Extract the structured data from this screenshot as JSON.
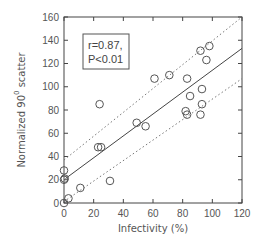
{
  "chart_data": {
    "type": "scatter",
    "title": "",
    "xlabel": "Infectivity (%)",
    "ylabel": "Normalized 90",
    "ylabel_superscript": "0",
    "ylabel_suffix": " scatter",
    "xlim": [
      0,
      120
    ],
    "ylim": [
      0,
      160
    ],
    "xticks": [
      0,
      20,
      40,
      60,
      80,
      100,
      120
    ],
    "yticks": [
      0,
      20,
      40,
      60,
      80,
      100,
      120,
      140,
      160
    ],
    "grid": false,
    "series": [
      {
        "name": "data",
        "marker": "open-circle",
        "x": [
          0,
          3,
          0,
          0.5,
          0,
          11,
          31,
          23,
          25,
          24,
          49,
          55,
          61,
          71,
          83,
          82,
          83,
          85,
          93,
          93,
          92,
          92,
          96,
          98
        ],
        "y": [
          0,
          4,
          20,
          21,
          28,
          13,
          19,
          48,
          48,
          85,
          69,
          66,
          107,
          110,
          107,
          79,
          76,
          92,
          98,
          85,
          76,
          131,
          123,
          135
        ]
      }
    ],
    "regression": {
      "style": "solid",
      "x": [
        1,
        120
      ],
      "y": [
        21,
        133
      ]
    },
    "confidence_bands": [
      {
        "name": "upper",
        "style": "dotted",
        "x": [
          0,
          120
        ],
        "y": [
          37,
          160
        ]
      },
      {
        "name": "lower",
        "style": "dotted",
        "x": [
          2,
          120
        ],
        "y": [
          3,
          107
        ]
      }
    ],
    "annotation": {
      "line1": "r=0.87,",
      "line2": "P<0.01"
    }
  }
}
